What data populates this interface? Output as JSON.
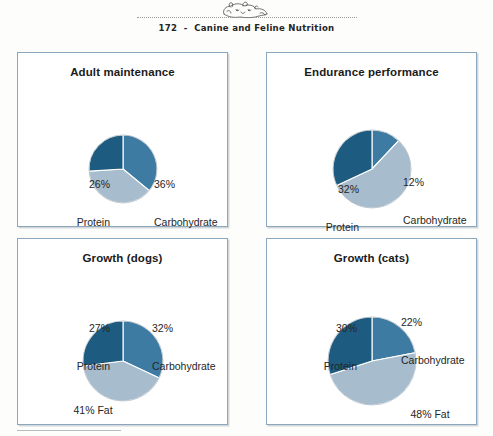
{
  "header": {
    "page_number": "172",
    "separator": "-",
    "book_title": "Canine and Feline Nutrition",
    "full_text": "172  -  Canine and Feline Nutrition",
    "ornament": "pets-illustration"
  },
  "colors": {
    "protein": "#1d5b80",
    "carbohydrate": "#3d7ba2",
    "fat": "#a7bccd",
    "panel_border": "#8ba7bd",
    "slice_divider": "#ffffff",
    "text": "#1b1b1b"
  },
  "chart_data": [
    {
      "type": "pie",
      "title": "Adult maintenance",
      "categories": [
        "Carbohydrate",
        "Fat",
        "Protein"
      ],
      "values": [
        36,
        38,
        26
      ],
      "labels": {
        "protein": {
          "pct": "26%",
          "name": "Protein"
        },
        "carbohydrate": {
          "pct": "36%",
          "name": "Carbohydrate"
        },
        "fat": {
          "pct": "38%",
          "name": "Fat"
        }
      },
      "start_angle": 0,
      "direction": "clockwise",
      "legend": "none"
    },
    {
      "type": "pie",
      "title": "Endurance performance",
      "categories": [
        "Carbohydrate",
        "Fat",
        "Protein"
      ],
      "values": [
        12,
        56,
        32
      ],
      "labels": {
        "protein": {
          "pct": "32%",
          "name": "Protein"
        },
        "carbohydrate": {
          "pct": "12%",
          "name": "Carbohydrate"
        },
        "fat": {
          "pct": "56%",
          "name": "Fat"
        }
      },
      "start_angle": 0,
      "direction": "clockwise",
      "legend": "none"
    },
    {
      "type": "pie",
      "title": "Growth (dogs)",
      "categories": [
        "Carbohydrate",
        "Fat",
        "Protein"
      ],
      "values": [
        32,
        41,
        27
      ],
      "labels": {
        "protein": {
          "pct": "27%",
          "name": "Protein"
        },
        "carbohydrate": {
          "pct": "32%",
          "name": "Carbohydrate"
        },
        "fat": {
          "pct": "41%",
          "name": "Fat"
        }
      },
      "start_angle": 0,
      "direction": "clockwise",
      "legend": "none"
    },
    {
      "type": "pie",
      "title": "Growth (cats)",
      "categories": [
        "Carbohydrate",
        "Fat",
        "Protein"
      ],
      "values": [
        22,
        48,
        30
      ],
      "labels": {
        "protein": {
          "pct": "30%",
          "name": "Protein"
        },
        "carbohydrate": {
          "pct": "22%",
          "name": "Carbohydrate"
        },
        "fat": {
          "pct": "48%",
          "name": "Fat"
        }
      },
      "start_angle": 0,
      "direction": "clockwise",
      "legend": "none"
    }
  ],
  "geometry": [
    {
      "cx": 105,
      "cy": 116,
      "r": 34
    },
    {
      "cx": 105,
      "cy": 116,
      "r": 39
    },
    {
      "cx": 105,
      "cy": 122,
      "r": 40
    },
    {
      "cx": 105,
      "cy": 122,
      "r": 44
    }
  ]
}
